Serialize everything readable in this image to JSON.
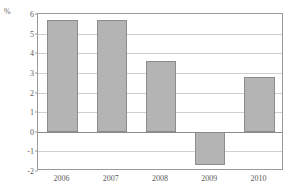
{
  "chart_data": {
    "type": "bar",
    "title": "",
    "subtitle": "",
    "xlabel": "",
    "ylabel": "%",
    "unit_label": "%",
    "categories": [
      "2006",
      "2007",
      "2008",
      "2009",
      "2010"
    ],
    "values": [
      5.7,
      5.7,
      3.6,
      -1.7,
      2.8
    ],
    "series": [
      {
        "name": "",
        "values": [
          5.7,
          5.7,
          3.6,
          -1.7,
          2.8
        ]
      }
    ],
    "ylim": [
      -2,
      6
    ],
    "yticks": [
      6,
      5,
      4,
      3,
      2,
      1,
      0,
      -1,
      -2
    ],
    "ytick_labels": [
      "6",
      "5",
      "4",
      "3",
      "2",
      "1",
      "0",
      "-1",
      "-2"
    ],
    "grid": true,
    "legend": false,
    "legend_position": "none",
    "bar_color": "#b4b4b4",
    "bar_border_color": "#8c8c8c",
    "gridline_color": "#cfcfcf",
    "zero_line_color": "#8a8a8a",
    "axis_color": "#9a9a9a",
    "text_color": "#5d5d5d"
  }
}
